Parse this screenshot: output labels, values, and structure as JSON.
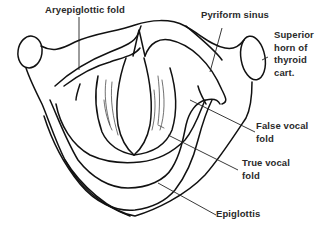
{
  "labels": {
    "aryepiglottic_fold": "Aryepiglottic fold",
    "pyriform_sinus": "Pyriform sinus",
    "superior_horn": [
      "Superior",
      "horn of",
      "thyroid",
      "cart."
    ],
    "false_vocal_fold": [
      "False vocal",
      "fold"
    ],
    "true_vocal_fold": [
      "True vocal",
      "fold"
    ],
    "epiglottis": "Epiglottis"
  },
  "colors": {
    "line": "#111111",
    "text": "#2a2a2a",
    "background": "#ffffff"
  }
}
